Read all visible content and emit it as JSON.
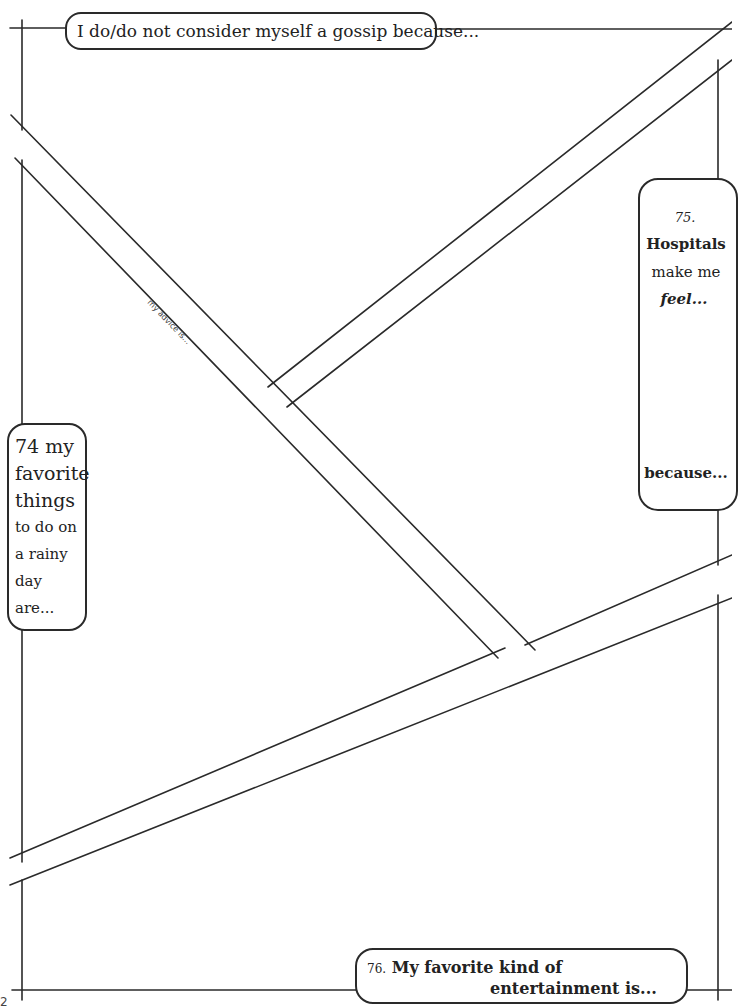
{
  "page": {
    "page_number": "2",
    "prompts": {
      "p73": {
        "number": "73.",
        "text": "I do/do not consider myself a gossip because..."
      },
      "p74": {
        "number": "74.",
        "lines": [
          "74 my",
          "favorite",
          "things",
          "to do on",
          "a rainy",
          "day",
          "are..."
        ]
      },
      "p75": {
        "number": "75.",
        "line1": "Hospitals",
        "line2": "make me",
        "line3": "feel...",
        "line4": "because..."
      },
      "p76": {
        "number": "76.",
        "line1": "My favorite kind of",
        "line2": "entertainment is..."
      }
    },
    "road_label": "my advice is...",
    "colors": {
      "ink": "#2a2a2a",
      "paper": "#ffffff"
    }
  }
}
